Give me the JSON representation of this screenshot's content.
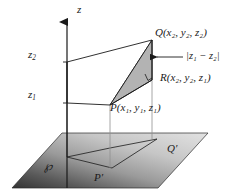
{
  "figure": {
    "width": 226,
    "height": 195,
    "background_color": "#ffffff",
    "line_color": "#1a1a1a",
    "triangle_fill_color": "#b3b3b3",
    "plane_gradient_dark": "#3a3a3a",
    "plane_gradient_light": "#d8d8d8"
  },
  "axis": {
    "z_label": "z",
    "tick_upper_label": "z",
    "tick_upper_sub": "2",
    "tick_lower_label": "z",
    "tick_lower_sub": "1"
  },
  "points": {
    "q": {
      "name": "Q",
      "coords": "(x₂, y₂, z₂)",
      "full": "Q(x₂, y₂, z₂)"
    },
    "r": {
      "name": "R",
      "coords": "(x₂, y₂, z₁)",
      "full": "R(x₂, y₂, z₁)"
    },
    "p": {
      "name": "P",
      "coords": "(x₁, y₁, z₁)",
      "full": "P(x₁, y₁, z₁)"
    },
    "p_prime": "P′",
    "q_prime": "Q′"
  },
  "annotations": {
    "vertical_distance": "|z₁ − z₂|",
    "plane_label": "℘",
    "right_angle_marker": "right-angle-marker"
  },
  "icons": {
    "axis_arrow": "arrow-up-icon",
    "callout_arrow": "arrow-left-icon"
  }
}
